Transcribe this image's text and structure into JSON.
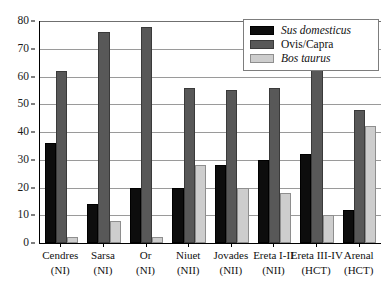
{
  "chart_data": {
    "type": "bar",
    "title": "",
    "xlabel": "",
    "ylabel": "",
    "ylim": [
      0,
      80
    ],
    "ytick_step": 10,
    "yticks": [
      0,
      10,
      20,
      30,
      40,
      50,
      60,
      70,
      80
    ],
    "ytick_labels": [
      "0",
      "10",
      "20",
      "30",
      "40",
      "50",
      "60",
      "70",
      "80"
    ],
    "grid": "horizontal",
    "legend_position": "upper-right",
    "categories": [
      "Cendres (NI)",
      "Sarsa (NI)",
      "Or (NI)",
      "Niuet (NII)",
      "Jovades (NII)",
      "Ereta I-II (NII)",
      "Ereta III-IV (HCT)",
      "Arenal (HCT)"
    ],
    "category_lines": [
      {
        "line1": "Cendres",
        "line2": "(NI)"
      },
      {
        "line1": "Sarsa",
        "line2": "(NI)"
      },
      {
        "line1": "Or",
        "line2": "(NI)"
      },
      {
        "line1": "Niuet",
        "line2": "(NII)"
      },
      {
        "line1": "Jovades",
        "line2": "(NII)"
      },
      {
        "line1": "Ereta I-II",
        "line2": "(NII)"
      },
      {
        "line1": "Ereta III-IV",
        "line2": "(HCT)"
      },
      {
        "line1": "Arenal",
        "line2": "(HCT)"
      }
    ],
    "series": [
      {
        "name": "Sus domesticus",
        "italic": true,
        "color": "#0d0d0d",
        "values": [
          36,
          14,
          20,
          20,
          28,
          30,
          32,
          12
        ]
      },
      {
        "name": "Ovis/Capra",
        "italic": false,
        "color": "#585858",
        "values": [
          62,
          76,
          78,
          56,
          55,
          56,
          64,
          48
        ]
      },
      {
        "name": "Bos taurus",
        "italic": true,
        "color": "#cdcdcd",
        "values": [
          2,
          8,
          2,
          28,
          20,
          18,
          10,
          42
        ]
      }
    ]
  },
  "legend": {
    "entries": [
      {
        "label": "Sus domesticus"
      },
      {
        "label": "Ovis/Capra"
      },
      {
        "label": "Bos taurus"
      }
    ]
  },
  "colors": {
    "series_0": "#0d0d0d",
    "series_1": "#585858",
    "series_2": "#cdcdcd",
    "axis": "#000000",
    "gridline": "#9a9a9a",
    "background": "#ffffff"
  }
}
